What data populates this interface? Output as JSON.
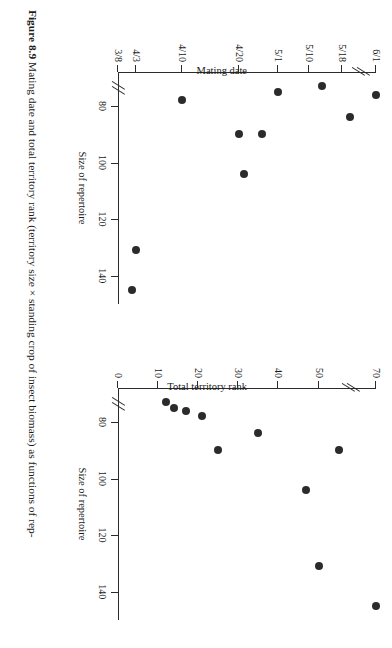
{
  "figure": {
    "number": "Figure 8.9",
    "caption": "Mating date and total territory rank (territory size × standing crop of insect biomass) as functions of rep-"
  },
  "chart_data": [
    {
      "id": "left",
      "type": "scatter",
      "title": "",
      "xlabel": "Size of repertoire",
      "ylabel": "Mating date",
      "xticks": [
        80,
        100,
        120,
        140
      ],
      "xticklabels": [
        "80",
        "100",
        "120",
        "140"
      ],
      "yticks": [
        "3/8",
        "4/3",
        "4/10",
        "4/20",
        "5/1",
        "5/10",
        "5/18",
        "6/1"
      ],
      "yticklabels": [
        "3/8",
        "4/3",
        "4/10",
        "4/20",
        "5/1",
        "5/10",
        "5/18",
        "6/1"
      ],
      "axis_break_y": true,
      "axis_break_x": true,
      "grid": false,
      "points": [
        {
          "x": 76,
          "y": "6/1"
        },
        {
          "x": 84,
          "y": "5/20"
        },
        {
          "x": 73,
          "y": "5/14"
        },
        {
          "x": 75,
          "y": "5/1"
        },
        {
          "x": 90,
          "y": "4/25"
        },
        {
          "x": 90,
          "y": "4/20"
        },
        {
          "x": 104,
          "y": "4/21"
        },
        {
          "x": 78,
          "y": "4/10"
        },
        {
          "x": 131,
          "y": "4/3"
        },
        {
          "x": 145,
          "y": "4/2"
        }
      ]
    },
    {
      "id": "right",
      "type": "scatter",
      "title": "",
      "xlabel": "Size of repertoire",
      "ylabel": "Total territory rank",
      "xticks": [
        80,
        100,
        120,
        140
      ],
      "xticklabels": [
        "80",
        "100",
        "120",
        "140"
      ],
      "yticks": [
        0,
        10,
        20,
        30,
        40,
        50,
        70
      ],
      "yticklabels": [
        "0",
        "10",
        "20",
        "30",
        "40",
        "50",
        "70"
      ],
      "ylim": [
        0,
        75
      ],
      "axis_break_y": true,
      "axis_break_x": true,
      "grid": false,
      "points": [
        {
          "x": 145,
          "y": 70
        },
        {
          "x": 131,
          "y": 50
        },
        {
          "x": 104,
          "y": 47
        },
        {
          "x": 90,
          "y": 55
        },
        {
          "x": 90,
          "y": 25
        },
        {
          "x": 84,
          "y": 35
        },
        {
          "x": 78,
          "y": 21
        },
        {
          "x": 76,
          "y": 17
        },
        {
          "x": 75,
          "y": 14
        },
        {
          "x": 73,
          "y": 12
        }
      ]
    }
  ]
}
